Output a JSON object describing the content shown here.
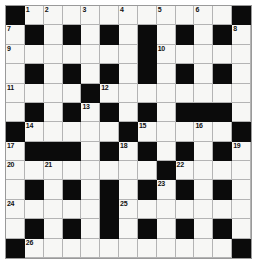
{
  "puzzle": {
    "title": "Crossword Grid",
    "type": "crossword",
    "rows": 13,
    "cols": 13,
    "colors": {
      "block": "#0b0b0b",
      "cell": "#f7f7f5",
      "grid_line": "#b4b4b4",
      "frame": "#8c8c8c",
      "number": "#111111",
      "page_background": "#ffffff"
    },
    "legend": {
      "black_symbol": "#",
      "white_symbol": "."
    },
    "layout": [
      "#...........#",
      ".#.#.#.#.#.#.",
      ".......#.....",
      ".#.#.#.#.#.#.",
      "....#........",
      ".#.#.#.#.###.",
      "#.....#.....#",
      ".###.#.#.#.#.",
      "........#....",
      ".#.#.#.#.#.#.",
      ".....#.......",
      ".#.#.#.#.#.#.",
      "#...........#"
    ],
    "numbers": [
      {
        "n": 1,
        "row": 0,
        "col": 1
      },
      {
        "n": 2,
        "row": 0,
        "col": 2
      },
      {
        "n": 3,
        "row": 0,
        "col": 4
      },
      {
        "n": 4,
        "row": 0,
        "col": 6
      },
      {
        "n": 5,
        "row": 0,
        "col": 8
      },
      {
        "n": 6,
        "row": 0,
        "col": 10
      },
      {
        "n": 7,
        "row": 1,
        "col": 0
      },
      {
        "n": 8,
        "row": 1,
        "col": 12
      },
      {
        "n": 9,
        "row": 2,
        "col": 0
      },
      {
        "n": 10,
        "row": 2,
        "col": 8
      },
      {
        "n": 11,
        "row": 4,
        "col": 0
      },
      {
        "n": 12,
        "row": 4,
        "col": 5
      },
      {
        "n": 13,
        "row": 5,
        "col": 4
      },
      {
        "n": 14,
        "row": 6,
        "col": 1
      },
      {
        "n": 15,
        "row": 6,
        "col": 7
      },
      {
        "n": 16,
        "row": 6,
        "col": 10
      },
      {
        "n": 17,
        "row": 7,
        "col": 0
      },
      {
        "n": 18,
        "row": 7,
        "col": 6
      },
      {
        "n": 19,
        "row": 7,
        "col": 12
      },
      {
        "n": 20,
        "row": 8,
        "col": 0
      },
      {
        "n": 21,
        "row": 8,
        "col": 2
      },
      {
        "n": 22,
        "row": 8,
        "col": 9
      },
      {
        "n": 23,
        "row": 9,
        "col": 8
      },
      {
        "n": 24,
        "row": 10,
        "col": 0
      },
      {
        "n": 25,
        "row": 10,
        "col": 6
      },
      {
        "n": 26,
        "row": 12,
        "col": 1
      }
    ]
  }
}
